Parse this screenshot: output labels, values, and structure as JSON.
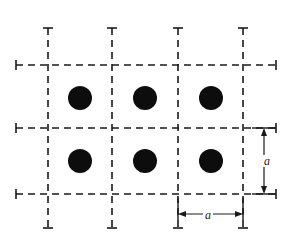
{
  "figure": {
    "background_color": "#ffffff",
    "line_color": "#1a1a1a",
    "atom_color": "#0d0d0d",
    "width": 293,
    "height": 243
  },
  "lattice": {
    "lattice_constant_label": "a",
    "vertical_gridlines_x": [
      48,
      112,
      178,
      243
    ],
    "horizontal_gridlines_y": [
      65,
      128,
      194
    ],
    "vertical_line_top": 28,
    "vertical_line_bottom": 228,
    "horizontal_line_left": 16,
    "horizontal_line_right": 276,
    "cap_half_width": 5,
    "atom_radius": 12,
    "atom_centers": [
      {
        "cx": 80,
        "cy": 98
      },
      {
        "cx": 145,
        "cy": 98
      },
      {
        "cx": 211,
        "cy": 98
      },
      {
        "cx": 80,
        "cy": 161
      },
      {
        "cx": 145,
        "cy": 161
      },
      {
        "cx": 211,
        "cy": 161
      }
    ]
  },
  "dimensions": {
    "horizontal": {
      "label": "a",
      "x_start": 178,
      "x_end": 243,
      "y": 214,
      "tick_top": 198,
      "tick_bottom": 220
    },
    "vertical": {
      "label": "a",
      "y_start": 128,
      "y_end": 194,
      "x": 264,
      "tick_left": 252,
      "tick_right": 276
    }
  }
}
